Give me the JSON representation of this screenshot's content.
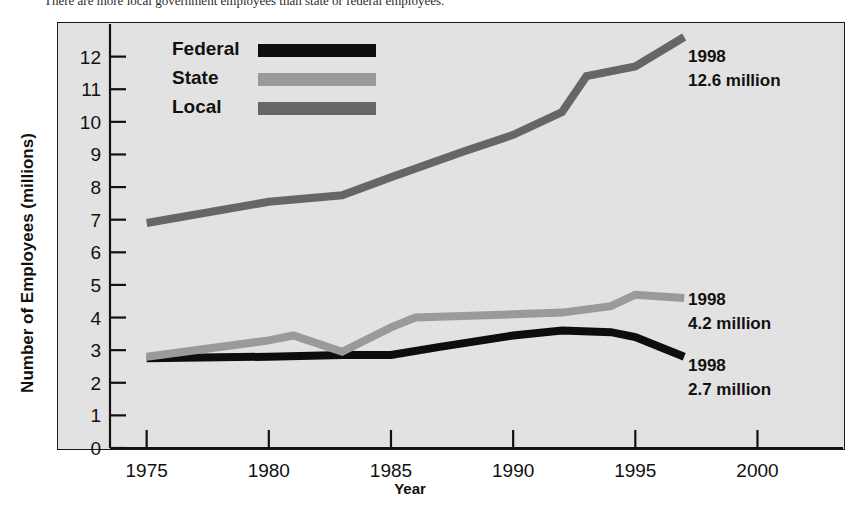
{
  "caption": {
    "clipped_text": "There are more local government employees than state or federal employees."
  },
  "chart_data": {
    "type": "line",
    "title": "",
    "xlabel": "Year",
    "ylabel": "Number of Employees (millions)",
    "xlim": [
      1973.5,
      2003.5
    ],
    "ylim": [
      0,
      13
    ],
    "xticks": [
      "1975",
      "1980",
      "1985",
      "1990",
      "1995",
      "2000"
    ],
    "xtick_values": [
      1975,
      1980,
      1985,
      1990,
      1995,
      2000
    ],
    "yticks": [
      "0",
      "1",
      "2",
      "3",
      "4",
      "5",
      "6",
      "7",
      "8",
      "9",
      "10",
      "11",
      "12"
    ],
    "ytick_values": [
      0,
      1,
      2,
      3,
      4,
      5,
      6,
      7,
      8,
      9,
      10,
      11,
      12
    ],
    "grid": false,
    "legend_position": "top-left-inside",
    "series": [
      {
        "name": "Federal",
        "color": "#0d0d0d",
        "x": [
          1975,
          1980,
          1983,
          1985,
          1987,
          1990,
          1992,
          1994,
          1995,
          1997
        ],
        "values": [
          2.75,
          2.8,
          2.85,
          2.85,
          3.1,
          3.45,
          3.6,
          3.55,
          3.4,
          2.8
        ]
      },
      {
        "name": "State",
        "color": "#9a9a9a",
        "x": [
          1975,
          1980,
          1981,
          1983,
          1985,
          1986,
          1990,
          1992,
          1994,
          1995,
          1997
        ],
        "values": [
          2.8,
          3.3,
          3.45,
          2.95,
          3.7,
          4.0,
          4.1,
          4.15,
          4.35,
          4.7,
          4.6
        ]
      },
      {
        "name": "Local",
        "color": "#666666",
        "x": [
          1975,
          1980,
          1983,
          1985,
          1988,
          1990,
          1992,
          1993,
          1995,
          1997
        ],
        "values": [
          6.9,
          7.55,
          7.75,
          8.3,
          9.1,
          9.6,
          10.3,
          11.4,
          11.7,
          12.6
        ]
      }
    ],
    "annotations": [
      {
        "id": "local-1998",
        "series": "Local",
        "year": "1998",
        "value_text": "12.6 million",
        "value": 12.6
      },
      {
        "id": "state-1998",
        "series": "State",
        "year": "1998",
        "value_text": "4.2 million",
        "value": 4.2
      },
      {
        "id": "federal-1998",
        "series": "Federal",
        "year": "1998",
        "value_text": "2.7 million",
        "value": 2.7
      }
    ],
    "legend": [
      {
        "label": "Federal",
        "color": "#0d0d0d"
      },
      {
        "label": "State",
        "color": "#9a9a9a"
      },
      {
        "label": "Local",
        "color": "#666666"
      }
    ]
  },
  "colors": {
    "panel_background": "#e2e2e2",
    "page_background": "#ffffff",
    "axis": "#111111",
    "federal": "#0d0d0d",
    "state": "#9a9a9a",
    "local": "#666666"
  }
}
